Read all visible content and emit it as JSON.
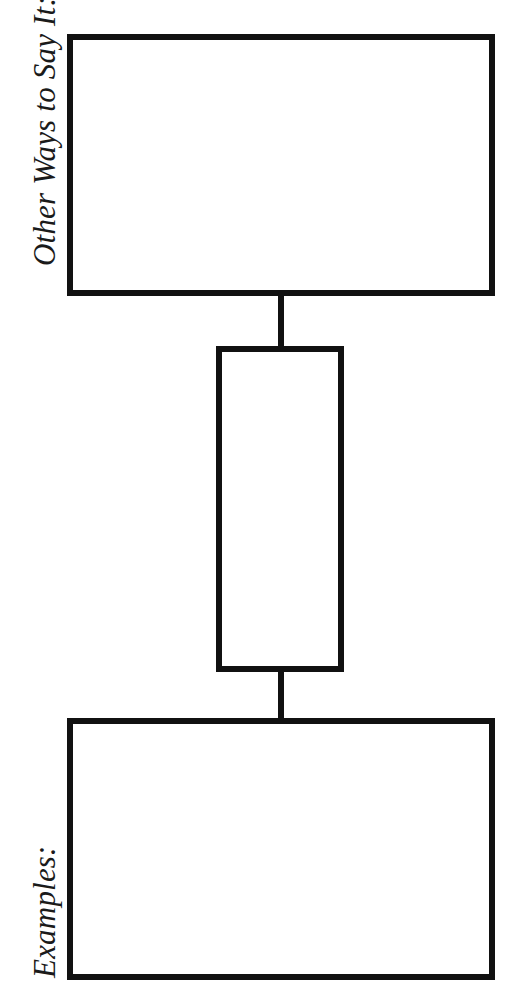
{
  "diagram": {
    "type": "graphic-organizer",
    "orientation": "rotated-90-ccw",
    "colors": {
      "stroke": "#111111",
      "background": "#ffffff",
      "text": "#1a1a1a"
    },
    "boxes": [
      {
        "id": "top",
        "label": "Other Ways to Say It:"
      },
      {
        "id": "middle",
        "label": ""
      },
      {
        "id": "bottom",
        "label": "Examples:"
      }
    ],
    "connectors": [
      {
        "from": "top",
        "to": "middle"
      },
      {
        "from": "middle",
        "to": "bottom"
      }
    ]
  }
}
